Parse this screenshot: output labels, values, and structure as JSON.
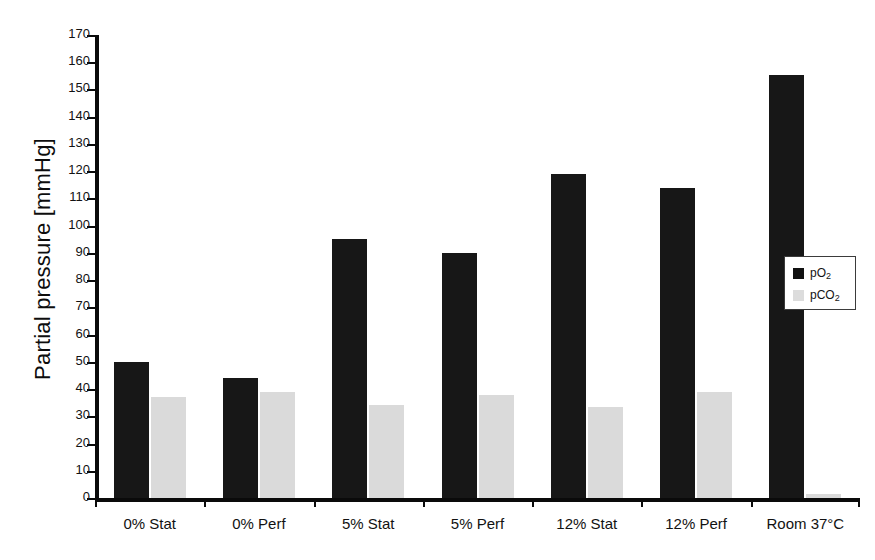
{
  "chart_data": {
    "type": "bar",
    "title": "",
    "xlabel": "",
    "ylabel": "Partial pressure [mmHg]",
    "ylim": [
      0,
      170
    ],
    "ytick_step": 10,
    "grid": false,
    "legend_position": "right",
    "categories": [
      "0% Stat",
      "0% Perf",
      "5% Stat",
      "5% Perf",
      "12% Stat",
      "12% Perf",
      "Room 37°C"
    ],
    "series": [
      {
        "name": "pO2",
        "label_html": "pO<sub>2</sub>",
        "color": "#171717",
        "values": [
          50,
          44,
          95,
          90,
          119,
          114,
          155.5
        ]
      },
      {
        "name": "pCO2",
        "label_html": "pCO<sub>2</sub>",
        "color": "#dadada",
        "values": [
          37,
          39,
          34,
          38,
          33.5,
          39,
          1.5
        ]
      }
    ],
    "ytick_labels": [
      "0",
      "10",
      "20",
      "30",
      "40",
      "50",
      "60",
      "70",
      "80",
      "90",
      "100",
      "110",
      "120",
      "130",
      "140",
      "150",
      "160",
      "170"
    ]
  },
  "axis": {
    "y_title": "Partial pressure [mmHg]"
  },
  "legend": {
    "entries": [
      {
        "label": "pO2",
        "color": "#171717"
      },
      {
        "label": "pCO2",
        "color": "#dadada"
      }
    ]
  }
}
